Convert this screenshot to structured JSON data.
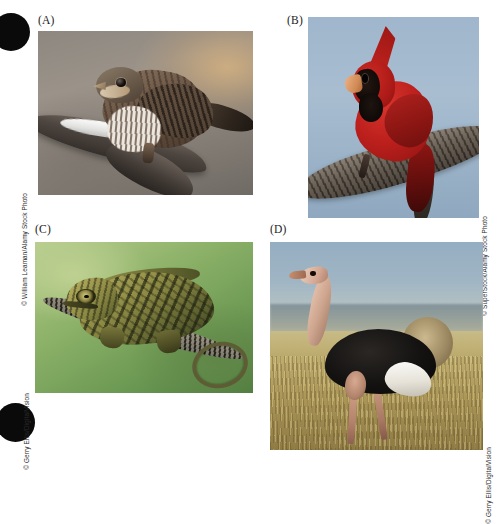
{
  "figure": {
    "panels": [
      {
        "id": "A",
        "label": "(A)",
        "credit": "© William Leaman/Alamy Stock Photo",
        "subject": "sparrow-on-snowy-branch"
      },
      {
        "id": "B",
        "label": "(B)",
        "credit": "© SuperStock/Alamy Stock Photo",
        "subject": "northern-cardinal-on-branch"
      },
      {
        "id": "C",
        "label": "(C)",
        "credit": "© Gerry Ellis/DigitalVision",
        "subject": "chameleon-on-twig"
      },
      {
        "id": "D",
        "label": "(D)",
        "credit": "© Gerry Ellis/DigitalVision",
        "subject": "ostrich-in-grassland"
      }
    ],
    "marks": {
      "registration_dot_top": "black-circle",
      "registration_dot_bottom": "black-circle"
    },
    "colors": {
      "background": "#ffffff",
      "label_text": "#1a1a1a",
      "credit_text": "#2b2b2b",
      "registration_dot": "#0a0a0a"
    }
  }
}
